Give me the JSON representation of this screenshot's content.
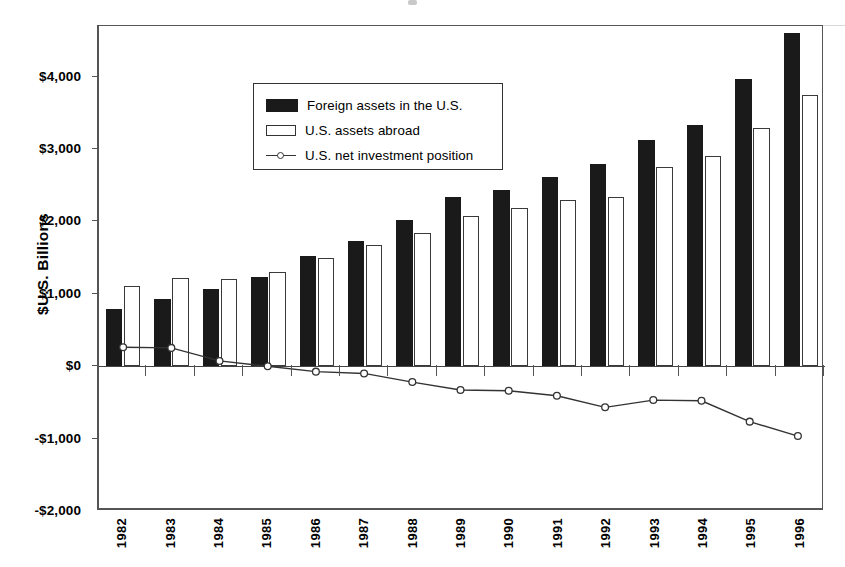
{
  "chart_data": {
    "type": "bar",
    "title": "",
    "subtitle": "",
    "xlabel": "",
    "ylabel": "$U.S. Billions",
    "ylim": [
      -2000,
      4600
    ],
    "ytick_values": [
      4000,
      3000,
      2000,
      1000,
      0,
      -1000,
      -2000
    ],
    "ytick_labels": [
      "$4,000",
      "$3,000",
      "$2,000",
      "$1,000",
      "$0",
      "-$1,000",
      "-$2,000"
    ],
    "grid": false,
    "legend_position": "upper-left-inside",
    "categories": [
      "1982",
      "1983",
      "1984",
      "1985",
      "1986",
      "1987",
      "1988",
      "1989",
      "1990",
      "1991",
      "1992",
      "1993",
      "1994",
      "1995",
      "1996"
    ],
    "series": [
      {
        "name": "Foreign assets in the U.S.",
        "type": "bar",
        "color": "#1a1a1a",
        "values": [
          790,
          930,
          1060,
          1230,
          1520,
          1730,
          2020,
          2340,
          2440,
          2610,
          2800,
          3120,
          3330,
          3970,
          4600
        ]
      },
      {
        "name": "U.S. assets abroad",
        "type": "bar",
        "color": "#ffffff",
        "values": [
          1110,
          1220,
          1210,
          1300,
          1500,
          1680,
          1840,
          2080,
          2180,
          2290,
          2340,
          2750,
          2910,
          3290,
          3740
        ]
      },
      {
        "name": "U.S. net investment position",
        "type": "line",
        "color": "#333333",
        "marker": "open-circle",
        "values": [
          235,
          225,
          45,
          -30,
          -105,
          -130,
          -250,
          -360,
          -370,
          -440,
          -600,
          -500,
          -510,
          -800,
          -1000
        ]
      }
    ]
  },
  "legend": {
    "items": [
      {
        "label": "Foreign assets in the U.S.",
        "swatch": "filled-square-dark"
      },
      {
        "label": "U.S. assets abroad",
        "swatch": "open-square-light"
      },
      {
        "label": "U.S. net investment position",
        "swatch": "line-with-open-circle-marker"
      }
    ]
  },
  "axes": {
    "y_title": "$U.S. Billions"
  }
}
